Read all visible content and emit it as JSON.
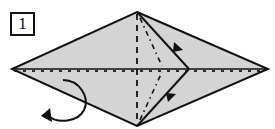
{
  "diagram": {
    "step": {
      "number": "1"
    },
    "colors": {
      "paper_fill": "#d4d4d4",
      "line": "#111111",
      "background": "#ffffff"
    },
    "shape": {
      "type": "kite / diamond base",
      "vertices": {
        "top": [
          137,
          12
        ],
        "right": [
          268,
          69
        ],
        "bottom": [
          137,
          126
        ],
        "left": [
          12,
          69
        ]
      },
      "inner_fold_point": [
        189,
        69
      ]
    },
    "fold_lines": [
      {
        "type": "valley (dashed)",
        "from": [
          137,
          12
        ],
        "to": [
          137,
          126
        ],
        "description": "vertical center crease"
      },
      {
        "type": "existing crease with dashed overlay",
        "from": [
          12,
          69
        ],
        "to": [
          268,
          69
        ],
        "description": "horizontal center line"
      },
      {
        "type": "mountain (dash-dot)",
        "from": [
          137,
          12
        ],
        "to": [
          160,
          69
        ],
        "description": "upper diagonal crease"
      },
      {
        "type": "mountain (dash-dot)",
        "from": [
          137,
          126
        ],
        "to": [
          160,
          69
        ],
        "description": "lower diagonal crease"
      },
      {
        "type": "edge",
        "from": [
          137,
          12
        ],
        "to": [
          189,
          69
        ],
        "description": "upper flap edge"
      },
      {
        "type": "edge",
        "from": [
          137,
          126
        ],
        "to": [
          189,
          69
        ],
        "description": "lower flap edge"
      }
    ],
    "arrows": [
      {
        "kind": "fold-direction arrowhead",
        "position": [
          178,
          47
        ],
        "direction": "down-right"
      },
      {
        "kind": "fold-direction arrowhead",
        "position": [
          170,
          97
        ],
        "direction": "up-right"
      },
      {
        "kind": "turn-over arrow",
        "position": [
          60,
          100
        ],
        "description": "curved arrow indicating turn model over"
      }
    ]
  }
}
